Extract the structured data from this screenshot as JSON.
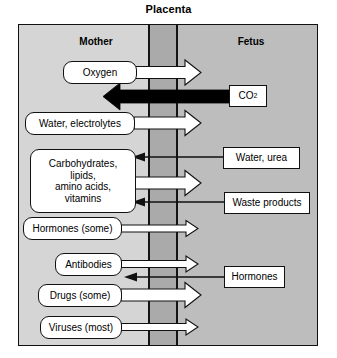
{
  "title": "Placenta",
  "columns": {
    "mother": "Mother",
    "fetus": "Fetus"
  },
  "colors": {
    "page_background": "#ffffff",
    "mother_band": "#d5d5d5",
    "placenta_band": "#aaaaaa",
    "fetus_band": "#bdbdbd",
    "line": "#141414",
    "label_fill": "#ffffff",
    "arrow_white_fill": "#ffffff",
    "arrow_black_fill": "#000000"
  },
  "mother_labels": [
    {
      "id": "oxygen",
      "text": "Oxygen"
    },
    {
      "id": "water-electrolytes",
      "text": "Water, electrolytes"
    },
    {
      "id": "nutrients",
      "line1": "Carbohydrates,",
      "line2": "lipids,",
      "line3": "amino acids,",
      "line4": "vitamins"
    },
    {
      "id": "hormones-some",
      "text": "Hormones (some)"
    },
    {
      "id": "antibodies",
      "text": "Antibodies"
    },
    {
      "id": "drugs-some",
      "text": "Drugs (some)"
    },
    {
      "id": "viruses-most",
      "text": "Viruses (most)"
    }
  ],
  "fetus_labels": [
    {
      "id": "co2",
      "text": "CO",
      "subscript": "2"
    },
    {
      "id": "water-urea",
      "text": "Water, urea"
    },
    {
      "id": "waste-products",
      "text": "Waste products"
    },
    {
      "id": "hormones",
      "text": "Hormones"
    }
  ],
  "transfers": [
    {
      "from": "Oxygen",
      "direction": "mother-to-fetus",
      "style": "thick-white"
    },
    {
      "from": "CO2",
      "direction": "fetus-to-mother",
      "style": "thick-black"
    },
    {
      "from": "Water, electrolytes",
      "direction": "mother-to-fetus",
      "style": "thick-white"
    },
    {
      "from": "Water, urea",
      "direction": "fetus-to-mother",
      "style": "thin-black"
    },
    {
      "from": "Carbohydrates, lipids, amino acids, vitamins",
      "direction": "mother-to-fetus",
      "style": "thick-white"
    },
    {
      "from": "Waste products",
      "direction": "fetus-to-mother",
      "style": "thin-black"
    },
    {
      "from": "Hormones (some)",
      "direction": "mother-to-fetus",
      "style": "thin-white"
    },
    {
      "from": "Antibodies",
      "direction": "mother-to-fetus",
      "style": "thin-white"
    },
    {
      "from": "Hormones",
      "direction": "fetus-to-mother",
      "style": "thin-black"
    },
    {
      "from": "Drugs (some)",
      "direction": "mother-to-fetus",
      "style": "thick-white"
    },
    {
      "from": "Viruses (most)",
      "direction": "mother-to-fetus",
      "style": "thin-white"
    }
  ]
}
